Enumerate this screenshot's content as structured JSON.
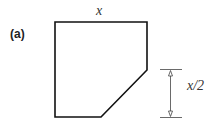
{
  "figure": {
    "panel_label": "(a)",
    "top_label": "x",
    "dimension_label": "x/2",
    "colors": {
      "stroke": "#111111",
      "dimension": "#444444"
    }
  }
}
